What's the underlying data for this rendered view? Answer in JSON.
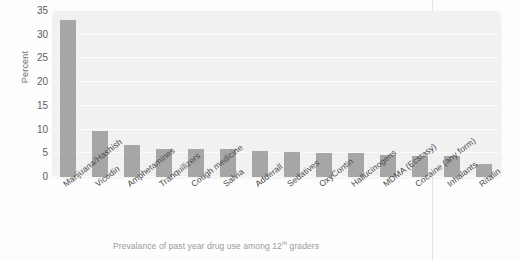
{
  "figure": {
    "caption_prefix": "Prevalance of past year drug use among 12",
    "caption_superscript": "th",
    "caption_suffix": " graders"
  },
  "style": {
    "bar_color": "#a6a6a6",
    "panel_background": "#f1f1f1",
    "gridline_color": "#fbfbfb",
    "page_background": "#fdfdfd",
    "tick_text_color": "#5e5e5e",
    "caption_color": "#9a9a9a",
    "page_rule_color": "#e2e2e2"
  },
  "chart_data": {
    "type": "bar",
    "title": "",
    "subtitle": "",
    "xlabel": "",
    "ylabel": "Percent",
    "ylim": [
      0,
      35
    ],
    "yticks": [
      0,
      5,
      10,
      15,
      20,
      25,
      30,
      35
    ],
    "ytick_labels": [
      "0",
      "5",
      "10",
      "15",
      "20",
      "25",
      "30",
      "35"
    ],
    "grid": true,
    "grid_axis": "y",
    "legend": false,
    "legend_position": "none",
    "annotation": "Prevalance of past year drug use among 12th graders",
    "categories": [
      "Marijuana/Hashish",
      "Vicodin",
      "Amphetamines",
      "Tranquilizers",
      "Cough medicine",
      "Salvia",
      "Adderall",
      "Sedatives",
      "OxyContin",
      "Hallucinogens",
      "MDMA (Ecstasy)",
      "Cocaine (any form)",
      "Inhalants",
      "Ritalin"
    ],
    "values": [
      33.1,
      9.7,
      6.8,
      6.0,
      5.9,
      5.9,
      5.4,
      5.2,
      5.1,
      5.0,
      4.7,
      4.4,
      4.5,
      2.7
    ]
  }
}
